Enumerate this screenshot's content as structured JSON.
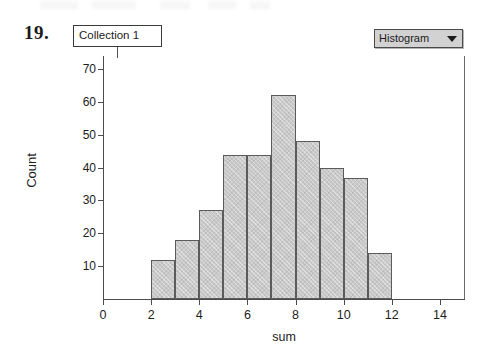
{
  "problem": {
    "number": "19."
  },
  "collection": {
    "title": "Collection 1"
  },
  "plot_type_selector": {
    "value": "Histogram",
    "caret_icon": "chevron-down-icon"
  },
  "chart_data": {
    "type": "bar",
    "title": "",
    "subtitle": "",
    "xlabel": "sum",
    "ylabel": "Count",
    "grid": false,
    "legend": "none",
    "xlim": [
      0,
      15
    ],
    "ylim": [
      0,
      74
    ],
    "bin_width": 1,
    "bin_starts": [
      2,
      3,
      4,
      5,
      6,
      7,
      8,
      9,
      10,
      11
    ],
    "categories": [
      "2-3",
      "3-4",
      "4-5",
      "5-6",
      "6-7",
      "7-8",
      "8-9",
      "9-10",
      "10-11",
      "11-12"
    ],
    "values": [
      12,
      18,
      27,
      44,
      44,
      62,
      48,
      40,
      37,
      14
    ],
    "xticks": [
      0,
      2,
      4,
      6,
      8,
      10,
      12,
      14
    ],
    "xtick_labels": [
      "0",
      "2",
      "4",
      "6",
      "8",
      "10",
      "12",
      "14"
    ],
    "yticks": [
      10,
      20,
      30,
      40,
      50,
      60,
      70
    ],
    "ytick_labels": [
      "10",
      "20",
      "30",
      "40",
      "50",
      "60",
      "70"
    ],
    "bar_fill_color": "#c9c9c9",
    "bar_border_color": "#5b5b5b",
    "axis_color": "#4c4c4c"
  }
}
